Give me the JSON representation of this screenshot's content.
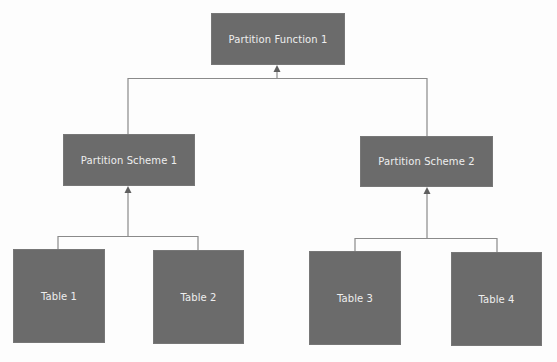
{
  "diagram": {
    "title": "",
    "colors": {
      "node_fill": "#6b6b6b",
      "node_text": "#eeeeee",
      "connector": "#8a8a8a",
      "background": "#fdfdfd"
    },
    "nodes": {
      "function": {
        "label": "Partition Function 1"
      },
      "scheme1": {
        "label": "Partition Scheme 1"
      },
      "scheme2": {
        "label": "Partition Scheme 2"
      },
      "table1": {
        "label": "Table 1"
      },
      "table2": {
        "label": "Table 2"
      },
      "table3": {
        "label": "Table 3"
      },
      "table4": {
        "label": "Table 4"
      }
    },
    "edges": [
      {
        "from": "scheme1",
        "to": "function"
      },
      {
        "from": "scheme2",
        "to": "function"
      },
      {
        "from": "table1",
        "to": "scheme1"
      },
      {
        "from": "table2",
        "to": "scheme1"
      },
      {
        "from": "table3",
        "to": "scheme2"
      },
      {
        "from": "table4",
        "to": "scheme2"
      }
    ]
  }
}
